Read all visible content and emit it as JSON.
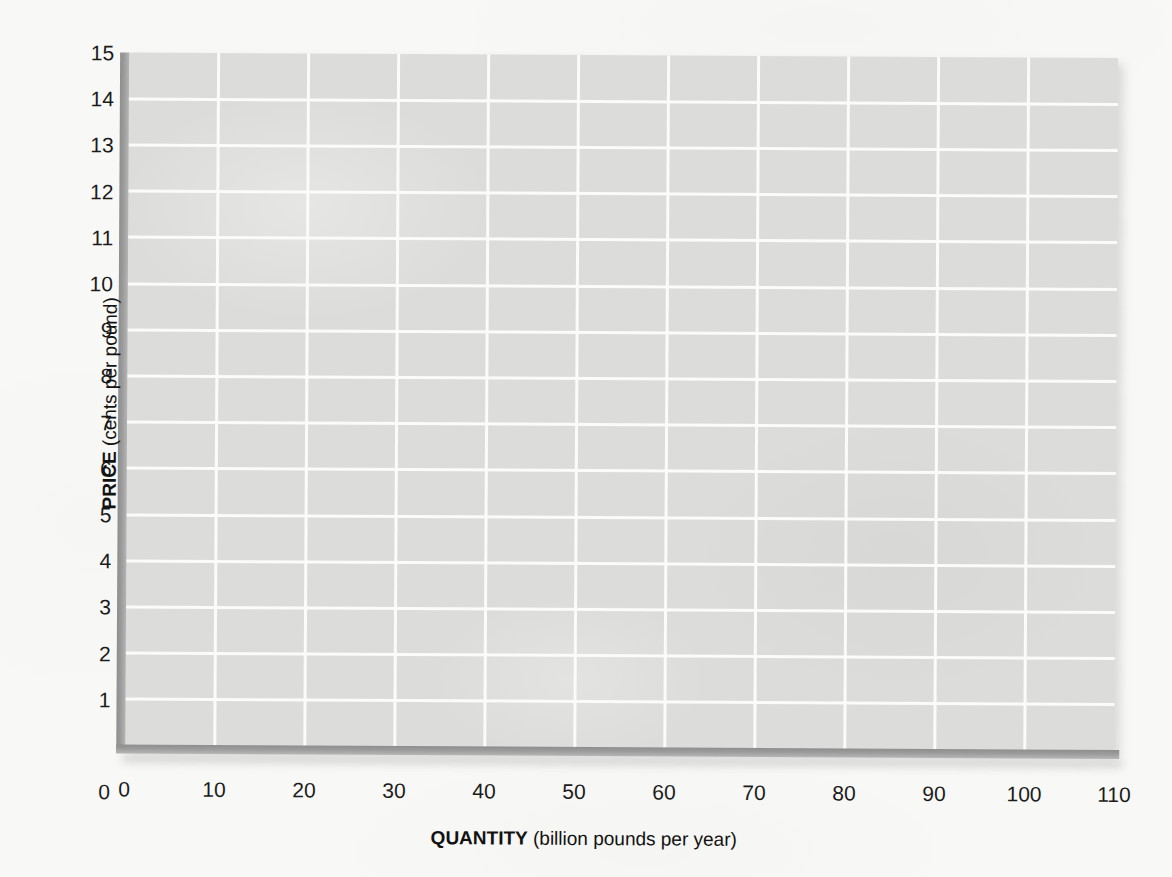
{
  "chart_data": {
    "type": "line",
    "title": "",
    "subtitle": "",
    "xlabel_strong": "QUANTITY",
    "xlabel_unit": "(billion pounds per year)",
    "ylabel_strong": "PRICE",
    "ylabel_unit": "(cents per pound)",
    "xlim": [
      0,
      110
    ],
    "ylim": [
      0,
      15
    ],
    "xticks": [
      0,
      10,
      20,
      30,
      40,
      50,
      60,
      70,
      80,
      90,
      100,
      110
    ],
    "yticks": [
      0,
      1,
      2,
      3,
      4,
      5,
      6,
      7,
      8,
      9,
      10,
      11,
      12,
      13,
      14,
      15
    ],
    "xtick_labels": [
      "0",
      "10",
      "20",
      "30",
      "40",
      "50",
      "60",
      "70",
      "80",
      "90",
      "100",
      "110"
    ],
    "ytick_labels": [
      "0",
      "1",
      "2",
      "3",
      "4",
      "5",
      "6",
      "7",
      "8",
      "9",
      "10",
      "11",
      "12",
      "13",
      "14",
      "15"
    ],
    "grid": true,
    "grid_color": "#fbfbfa",
    "plot_background": "#dcdddb",
    "axis_color": "#9b9b9b",
    "legend": [],
    "annotations": [],
    "series": [],
    "note": "Blank coordinate grid with no plotted data series"
  },
  "figure": {
    "page_background": "#f8f8f6",
    "text_color": "#1b1b1b"
  }
}
